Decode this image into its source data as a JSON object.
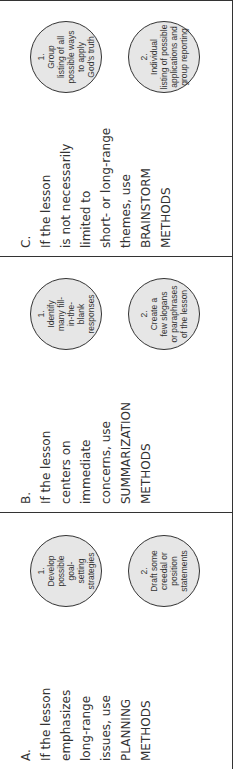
{
  "columns": [
    {
      "label": "A.",
      "lines": [
        "If the lesson",
        "emphasizes",
        "long-range",
        "issues, use",
        "PLANNING",
        "METHODS"
      ],
      "circles": [
        {
          "number": "1.",
          "lines": [
            "Develop",
            "possible",
            "goal-",
            "setting",
            "strategies"
          ]
        },
        {
          "number": "2.",
          "lines": [
            "Draft some",
            "creedal or",
            "position",
            "statements"
          ]
        }
      ]
    },
    {
      "label": "B.",
      "lines": [
        "If the lesson",
        "centers on",
        "immediate",
        "concerns, use",
        "SUMMARIZATION",
        "METHODS"
      ],
      "circles": [
        {
          "number": "1.",
          "lines": [
            "Identify",
            "many fill-",
            "in-the-",
            "blank",
            "responses"
          ]
        },
        {
          "number": "2.",
          "lines": [
            "Create a",
            "few slogans",
            "or paraphrases",
            "of the lesson"
          ]
        }
      ]
    },
    {
      "label": "C.",
      "lines": [
        "If the lesson",
        "is not necessarily",
        "limited to",
        "short- or long-range",
        "themes, use",
        "BRAINSTORM",
        "METHODS"
      ],
      "circles": [
        {
          "number": "1.",
          "lines": [
            "Group",
            "listing of all",
            "possible ways",
            "to apply",
            "God's truth"
          ]
        },
        {
          "number": "2.",
          "lines": [
            "Individual",
            "listing of possible",
            "applications and",
            "group reporting"
          ]
        }
      ]
    }
  ],
  "footer": {
    "text": "HOW TO CONCLUDE the lesson (text partially cut off)"
  }
}
